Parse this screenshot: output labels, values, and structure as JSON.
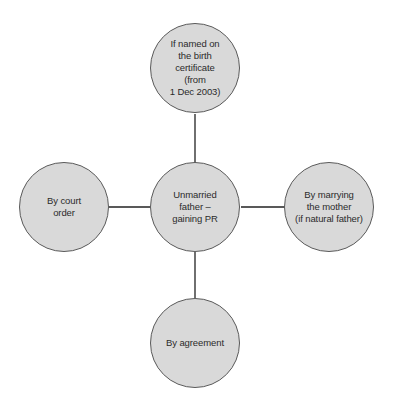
{
  "diagram": {
    "type": "hub-and-spoke",
    "colors": {
      "node_fill": "#d9d9d9",
      "node_stroke": "#5a5a5a",
      "connector": "#222222",
      "text": "#2b2b2b"
    },
    "center": {
      "label": "Unmarried\nfather –\ngaining PR"
    },
    "nodes": {
      "top": {
        "label": "If named on\nthe birth\ncertificate\n(from\n1 Dec 2003)"
      },
      "left": {
        "label": "By court\norder"
      },
      "right": {
        "label": "By marrying\nthe mother\n(if natural father)"
      },
      "bottom": {
        "label": "By agreement"
      }
    }
  }
}
